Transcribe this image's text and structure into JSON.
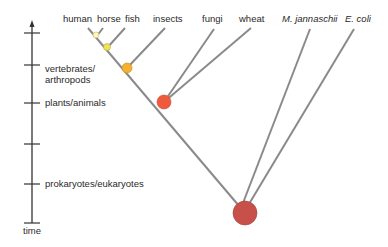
{
  "diagram": {
    "type": "phylogenetic-tree",
    "axis": {
      "label": "time",
      "ticks": [
        {
          "y": 33,
          "label": ""
        },
        {
          "y": 65,
          "label": "vertebrates/\narthropods"
        },
        {
          "y": 103,
          "label": "plants/animals"
        },
        {
          "y": 144,
          "label": ""
        },
        {
          "y": 184,
          "label": "prokaryotes/eukaryotes"
        },
        {
          "y": 223,
          "label": ""
        }
      ]
    },
    "leaves": [
      {
        "name": "human",
        "italic": false
      },
      {
        "name": "horse",
        "italic": false
      },
      {
        "name": "fish",
        "italic": false
      },
      {
        "name": "insects",
        "italic": false
      },
      {
        "name": "fungi",
        "italic": false
      },
      {
        "name": "wheat",
        "italic": false
      },
      {
        "name": "M. jannaschii",
        "italic": true
      },
      {
        "name": "E. coli",
        "italic": true
      }
    ],
    "tick_labels": {
      "vertebrates_line1": "vertebrates/",
      "vertebrates_line2": "arthropods",
      "plants_animals": "plants/animals",
      "prokaryotes_eukaryotes": "prokaryotes/eukaryotes",
      "time": "time"
    },
    "nodes": [
      {
        "id": "human-horse",
        "color": "#fdf6c0",
        "r": 3
      },
      {
        "id": "fish",
        "color": "#f2e25a",
        "r": 3.5
      },
      {
        "id": "vertebrates-arthropods",
        "color": "#f4b030",
        "r": 5
      },
      {
        "id": "plants-animals",
        "color": "#ef5a3c",
        "r": 7
      },
      {
        "id": "prokaryotes-eukaryotes",
        "color": "#c8504a",
        "r": 12
      }
    ],
    "colors": {
      "branch": "#8a8a8a",
      "axis": "#333333"
    }
  }
}
